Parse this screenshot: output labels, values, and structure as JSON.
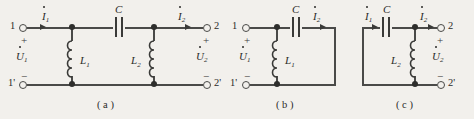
{
  "figure": {
    "background_color": "#f2f0ec",
    "line_color": "#4a4a48"
  },
  "panels": [
    {
      "caption": "( a )",
      "terminals": {
        "top_left": "1",
        "bottom_left": "1'",
        "top_right": "2",
        "bottom_right": "2'"
      },
      "signs": {
        "left_plus": "+",
        "left_minus": "−",
        "right_plus": "+",
        "right_minus": "−"
      },
      "currents": [
        {
          "symbol": "I",
          "sub": "1",
          "direction": "right"
        },
        {
          "symbol": "I",
          "sub": "2",
          "direction": "right"
        }
      ],
      "voltages": [
        {
          "symbol": "U",
          "sub": "1"
        },
        {
          "symbol": "U",
          "sub": "2"
        }
      ],
      "components": [
        {
          "type": "capacitor",
          "label": "C",
          "sub": ""
        },
        {
          "type": "inductor",
          "label": "L",
          "sub": "1"
        },
        {
          "type": "inductor",
          "label": "L",
          "sub": "2"
        }
      ]
    },
    {
      "caption": "( b )",
      "terminals": {
        "top_left": "1",
        "bottom_left": "1'"
      },
      "signs": {
        "left_plus": "+",
        "left_minus": "−"
      },
      "currents": [
        {
          "symbol": "I",
          "sub": "2",
          "direction": "right"
        }
      ],
      "voltages": [
        {
          "symbol": "U",
          "sub": "1"
        }
      ],
      "components": [
        {
          "type": "capacitor",
          "label": "C",
          "sub": ""
        },
        {
          "type": "inductor",
          "label": "L",
          "sub": "1"
        }
      ]
    },
    {
      "caption": "( c )",
      "terminals": {
        "top_right": "2",
        "bottom_right": "2'"
      },
      "signs": {
        "right_plus": "+",
        "right_minus": "−"
      },
      "currents": [
        {
          "symbol": "I",
          "sub": "1",
          "direction": "right"
        },
        {
          "symbol": "I",
          "sub": "2",
          "direction": "right"
        }
      ],
      "voltages": [
        {
          "symbol": "U",
          "sub": "2"
        }
      ],
      "components": [
        {
          "type": "capacitor",
          "label": "C",
          "sub": ""
        },
        {
          "type": "inductor",
          "label": "L",
          "sub": "2"
        }
      ]
    }
  ]
}
